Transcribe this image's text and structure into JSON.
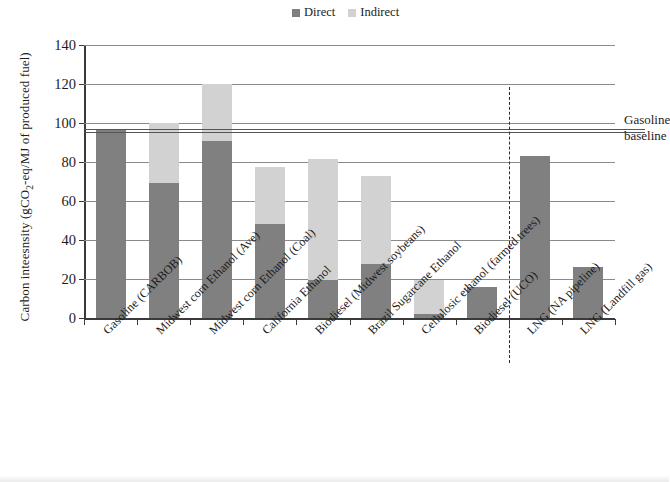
{
  "legend": {
    "position": "top-center",
    "entries": [
      {
        "label": "Direct",
        "color": "#808080"
      },
      {
        "label": "Indirect",
        "color": "#d2d2d2"
      }
    ]
  },
  "annotation": {
    "line1": "Gasoline",
    "line2": "baseline",
    "value": 96.5
  },
  "axis": {
    "y_title_main": "Carbon inteesnsity (gCO",
    "y_title_sub": "2",
    "y_title_rest": "-eq/MJ of produced fuel)",
    "y_ticks": [
      "0",
      "20",
      "40",
      "60",
      "80",
      "100",
      "120",
      "140"
    ],
    "y_min": 0,
    "y_max": 140,
    "y_step": 20
  },
  "chart_data": {
    "type": "bar",
    "stacked": true,
    "title": "",
    "xlabel": "",
    "ylabel": "Carbon inteesnsity (gCO2-eq/MJ of produced fuel)",
    "ylim": [
      0,
      140
    ],
    "ytick_step": 20,
    "grid": true,
    "legend_position": "top-center",
    "categories": [
      "Gasoline (CARBOB)",
      "Midwest corn Ethanol (Ave)",
      "Midwest corn Ethanol (Coal)",
      "California Ethanol",
      "Biodiesel (Midwest soybeans)",
      "Brazil Sugarcane Ethanol",
      "Cellulosic ethanol (farmed trees)",
      "Biodiesel (UCO)",
      "LNG (NA pipeline)",
      "LNG (Landfill gas)"
    ],
    "series": [
      {
        "name": "Direct",
        "color": "#808080",
        "values": [
          96.5,
          69,
          91,
          48,
          19.5,
          27.5,
          2,
          16,
          83,
          26
        ]
      },
      {
        "name": "Indirect",
        "color": "#d2d2d2",
        "values": [
          0,
          31,
          29,
          29.5,
          62,
          45.5,
          17.5,
          0,
          0,
          0
        ]
      }
    ],
    "totals": [
      96.5,
      100,
      120,
      77.5,
      81.5,
      73,
      19.5,
      16,
      83,
      26
    ],
    "annotations": [
      {
        "type": "hline",
        "value": 96.5,
        "label": "Gasoline baseline",
        "style": "double-solid"
      },
      {
        "type": "vline",
        "after_category_index": 7,
        "label": "",
        "style": "dashed"
      }
    ]
  }
}
